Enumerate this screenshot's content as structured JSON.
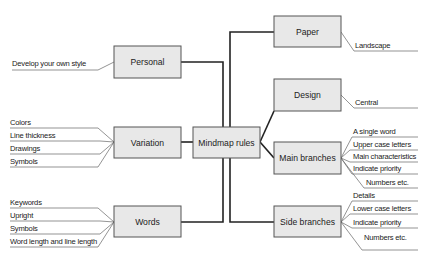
{
  "diagram": {
    "central": {
      "id": "mindmap",
      "label": "Mindmap rules"
    },
    "left_branches": [
      {
        "id": "personal",
        "label": "Personal",
        "items": [
          "Develop your own style"
        ]
      },
      {
        "id": "variation",
        "label": "Variation",
        "items": [
          "Colors",
          "Line thickness",
          "Drawings",
          "Symbols"
        ]
      },
      {
        "id": "words",
        "label": "Words",
        "items": [
          "Keywords",
          "Upright",
          "Symbols",
          "Word length and line length"
        ]
      }
    ],
    "right_branches": [
      {
        "id": "paper",
        "label": "Paper",
        "items": [
          "Landscape"
        ]
      },
      {
        "id": "design",
        "label": "Design",
        "items": [
          "Central"
        ]
      },
      {
        "id": "main-branches",
        "label": "Main branches",
        "items": [
          "A single word",
          "Upper case letters",
          "Main characteristics",
          "Indicate priority",
          "Numbers etc."
        ]
      },
      {
        "id": "side-branches",
        "label": "Side branches",
        "items": [
          "Details",
          "Lower case letters",
          "Indicate priority",
          "Numbers etc."
        ]
      }
    ],
    "colors": {
      "box_fill": "#e8e8e8",
      "box_stroke": "#555555",
      "line": "#222222"
    }
  }
}
